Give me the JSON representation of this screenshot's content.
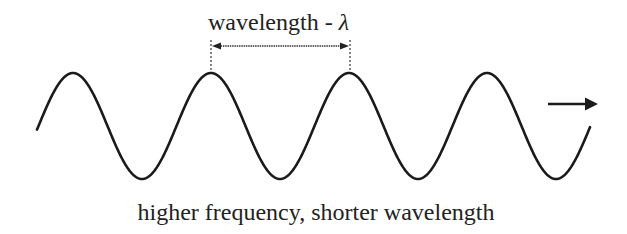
{
  "diagram": {
    "type": "transverse-wave",
    "wavelength_label": "wavelength - ",
    "lambda_symbol": "λ",
    "caption": "higher frequency, shorter wavelength",
    "direction": "right",
    "colors": {
      "wave": "#1a1a1a",
      "text": "#222222",
      "background": "#ffffff"
    },
    "wave_geometry": {
      "peaks_x": [
        73,
        211,
        350,
        488
      ],
      "troughs_x": [
        142,
        280,
        417,
        556
      ],
      "period_px": 138,
      "center_y": 126,
      "amplitude_px": 53
    }
  }
}
